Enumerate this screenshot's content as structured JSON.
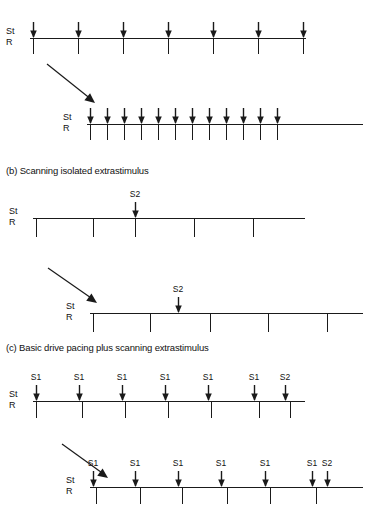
{
  "figure": {
    "background_color": "#ffffff",
    "ink_color": "#1a1a1a",
    "channel_labels": {
      "stimulus": "St",
      "response": "R"
    }
  },
  "panels": [
    {
      "id": "a",
      "heading": "",
      "heading_visible": false,
      "traces": [
        {
          "name": "fixed-rate-pacing-slow",
          "baseline": {
            "x": 30,
            "y": 38,
            "width": 276
          },
          "arrows": [
            {
              "x": 33,
              "label": ""
            },
            {
              "x": 78,
              "label": ""
            },
            {
              "x": 123,
              "label": ""
            },
            {
              "x": 168,
              "label": ""
            },
            {
              "x": 213,
              "label": ""
            },
            {
              "x": 258,
              "label": ""
            },
            {
              "x": 303,
              "label": ""
            }
          ],
          "ticks": [
            33,
            78,
            123,
            168,
            213,
            258,
            303
          ],
          "tick_length": 16
        },
        {
          "name": "fixed-rate-pacing-fast",
          "baseline": {
            "x": 87,
            "y": 124,
            "width": 276
          },
          "arrows": [
            {
              "x": 90,
              "label": ""
            },
            {
              "x": 107,
              "label": ""
            },
            {
              "x": 124,
              "label": ""
            },
            {
              "x": 141,
              "label": ""
            },
            {
              "x": 158,
              "label": ""
            },
            {
              "x": 175,
              "label": ""
            },
            {
              "x": 192,
              "label": ""
            },
            {
              "x": 209,
              "label": ""
            },
            {
              "x": 226,
              "label": ""
            },
            {
              "x": 243,
              "label": ""
            },
            {
              "x": 260,
              "label": ""
            },
            {
              "x": 277,
              "label": ""
            }
          ],
          "ticks": [
            90,
            107,
            124,
            141,
            158,
            175,
            192,
            209,
            226,
            243,
            260,
            277
          ],
          "tick_length": 16
        }
      ],
      "connector": {
        "x1": 47,
        "y1": 64,
        "x2": 95,
        "y2": 103
      }
    },
    {
      "id": "b",
      "heading": "(b) Scanning isolated extrastimulus",
      "heading_visible": true,
      "heading_pos": {
        "x": 6,
        "y": 165
      },
      "traces": [
        {
          "name": "scanning-extrastimulus-early",
          "baseline": {
            "x": 33,
            "y": 218,
            "width": 272
          },
          "arrows": [
            {
              "x": 135,
              "label": "S2"
            }
          ],
          "ticks": [
            36,
            93,
            135,
            194,
            253
          ],
          "tick_length": 19
        },
        {
          "name": "scanning-extrastimulus-late",
          "baseline": {
            "x": 90,
            "y": 313,
            "width": 273
          },
          "arrows": [
            {
              "x": 178,
              "label": "S2"
            }
          ],
          "ticks": [
            93,
            150,
            210,
            268,
            327
          ],
          "tick_length": 19
        }
      ],
      "connector": {
        "x1": 48,
        "y1": 268,
        "x2": 97,
        "y2": 303
      }
    },
    {
      "id": "c",
      "heading": "(c) Basic drive pacing plus scanning extrastimulus",
      "heading_visible": true,
      "heading_pos": {
        "x": 6,
        "y": 342
      },
      "traces": [
        {
          "name": "drive-pacing-extrastimulus-early",
          "baseline": {
            "x": 33,
            "y": 401,
            "width": 272
          },
          "arrows": [
            {
              "x": 36,
              "label": "S1"
            },
            {
              "x": 79,
              "label": "S1"
            },
            {
              "x": 122,
              "label": "S1"
            },
            {
              "x": 165,
              "label": "S1"
            },
            {
              "x": 208,
              "label": "S1"
            },
            {
              "x": 254,
              "label": "S1"
            },
            {
              "x": 285,
              "label": "S2"
            }
          ],
          "ticks": [
            36,
            82,
            125,
            168,
            211,
            259,
            290
          ],
          "tick_length": 17
        },
        {
          "name": "drive-pacing-extrastimulus-late",
          "baseline": {
            "x": 90,
            "y": 487,
            "width": 273
          },
          "arrows": [
            {
              "x": 93,
              "label": "S1"
            },
            {
              "x": 135,
              "label": "S1"
            },
            {
              "x": 178,
              "label": "S1"
            },
            {
              "x": 221,
              "label": "S1"
            },
            {
              "x": 265,
              "label": "S1"
            },
            {
              "x": 312,
              "label": "S1"
            },
            {
              "x": 327,
              "label": "S2"
            }
          ],
          "ticks": [
            96,
            140,
            182,
            227,
            270,
            316
          ],
          "tick_length": 17
        }
      ],
      "connector": {
        "x1": 62,
        "y1": 444,
        "x2": 108,
        "y2": 478
      }
    }
  ]
}
